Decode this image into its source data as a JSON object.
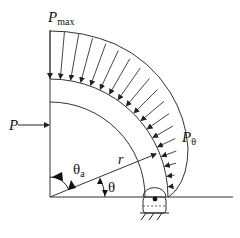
{
  "diagram": {
    "labels": {
      "p_max": "P",
      "p_max_sub": "max",
      "p_side": "P",
      "p_theta": "P",
      "p_theta_sub": "θ",
      "radius": "r",
      "theta_a": "θ",
      "theta_a_sub": "a",
      "theta": "θ"
    },
    "colors": {
      "stroke": "#333333",
      "background": "#ffffff"
    },
    "geometry": {
      "center": [
        50,
        197
      ],
      "outer_radius": 118,
      "inner_radius": 95,
      "load_max_length": 48,
      "load_arrow_count": 18
    }
  }
}
